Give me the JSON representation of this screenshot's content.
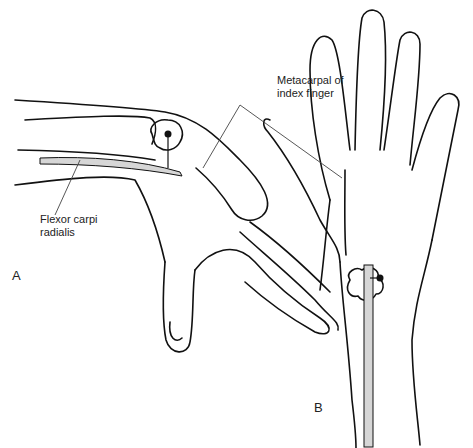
{
  "figure": {
    "panels": [
      {
        "id": "A",
        "letter": "A",
        "description": "Lateral view of flexed wrist and hand with flexor carpi radialis and palpation point"
      },
      {
        "id": "B",
        "letter": "B",
        "description": "Palmar view of hand and wrist with flexor carpi radialis tendon and palpation point"
      }
    ],
    "labels": {
      "metacarpal": "Metacarpal of\nindex finger",
      "flexor": "Flexor carpi\nradialis"
    },
    "colors": {
      "line": "#111111",
      "tendon_fill": "#d6d6d6",
      "leader": "#444444",
      "background": "#ffffff"
    }
  }
}
